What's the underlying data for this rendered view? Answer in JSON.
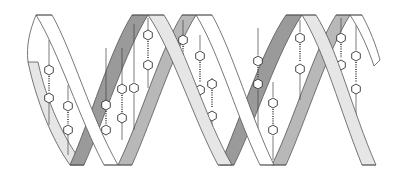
{
  "figure": {
    "subject": "DNA double helix",
    "strands": [
      "strand-a",
      "strand-b"
    ],
    "colors": {
      "background": "#ffffff",
      "ribbon_white": "#ffffff",
      "ribbon_light": "#e6e6e6",
      "ribbon_mid": "#b8b8b8",
      "ribbon_dark": "#9a9a9a",
      "outline": "#555555"
    },
    "base_pair_count": 12,
    "turns": 2
  }
}
